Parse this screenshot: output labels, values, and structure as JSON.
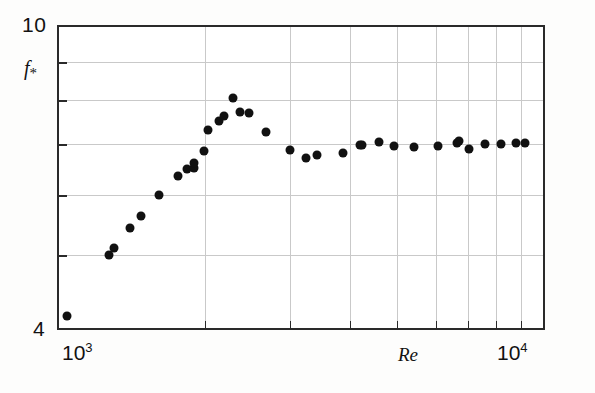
{
  "figure": {
    "background_color": "#fdfdfc",
    "plot_background_color": "#ffffff",
    "axis_color": "#2a2a2a",
    "grid_color": "#c9c9c9",
    "marker_color": "#111111"
  },
  "labels": {
    "y_max": "10",
    "y_min": "4",
    "y_axis_title": "f",
    "y_axis_subscript": "*",
    "x_min_mantissa": "10",
    "x_min_exponent": "3",
    "x_max_mantissa": "10",
    "x_max_exponent": "4",
    "x_axis_title": "Re"
  },
  "chart_data": {
    "type": "scatter",
    "title": "",
    "xlabel": "Re",
    "ylabel": "f*",
    "xscale": "log",
    "yscale": "log",
    "xlim": [
      1000,
      10000
    ],
    "ylim": [
      4,
      10
    ],
    "grid": true,
    "legend": null,
    "x_tick_labels": [
      "10^3",
      "10^4"
    ],
    "y_tick_labels": [
      "4",
      "10"
    ],
    "x_gridline_values": [
      2000,
      3000,
      4000,
      5000,
      6000,
      7000,
      8000,
      9000
    ],
    "y_gridline_values": [
      5,
      6,
      7,
      8,
      9
    ],
    "marker": "filled-circle",
    "points": [
      {
        "x": 1040,
        "y": 4.15
      },
      {
        "x": 1270,
        "y": 5.0
      },
      {
        "x": 1300,
        "y": 5.1
      },
      {
        "x": 1400,
        "y": 5.42
      },
      {
        "x": 1480,
        "y": 5.62
      },
      {
        "x": 1610,
        "y": 6.0
      },
      {
        "x": 1760,
        "y": 6.36
      },
      {
        "x": 1840,
        "y": 6.5
      },
      {
        "x": 1900,
        "y": 6.52
      },
      {
        "x": 1905,
        "y": 6.62
      },
      {
        "x": 1990,
        "y": 6.85
      },
      {
        "x": 2030,
        "y": 7.3
      },
      {
        "x": 2140,
        "y": 7.52
      },
      {
        "x": 2190,
        "y": 7.62
      },
      {
        "x": 2290,
        "y": 8.05
      },
      {
        "x": 2370,
        "y": 7.72
      },
      {
        "x": 2470,
        "y": 7.7
      },
      {
        "x": 2680,
        "y": 7.26
      },
      {
        "x": 3000,
        "y": 6.88
      },
      {
        "x": 3240,
        "y": 6.72
      },
      {
        "x": 3410,
        "y": 6.78
      },
      {
        "x": 3860,
        "y": 6.82
      },
      {
        "x": 4190,
        "y": 6.98
      },
      {
        "x": 4230,
        "y": 6.98
      },
      {
        "x": 4580,
        "y": 7.05
      },
      {
        "x": 4920,
        "y": 6.97
      },
      {
        "x": 5420,
        "y": 6.93
      },
      {
        "x": 6060,
        "y": 6.97
      },
      {
        "x": 6640,
        "y": 7.03
      },
      {
        "x": 6720,
        "y": 7.06
      },
      {
        "x": 7030,
        "y": 6.9
      },
      {
        "x": 7600,
        "y": 7.0
      },
      {
        "x": 8180,
        "y": 7.0
      },
      {
        "x": 8800,
        "y": 7.02
      },
      {
        "x": 9200,
        "y": 7.02
      }
    ]
  }
}
